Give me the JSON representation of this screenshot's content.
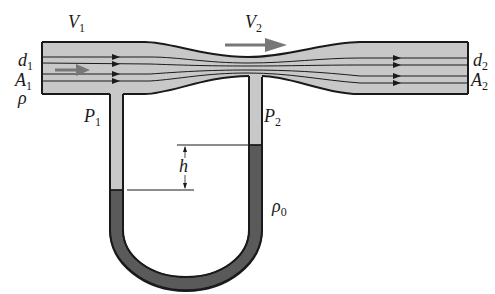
{
  "diagram": {
    "labels": {
      "v1": {
        "main": "V",
        "sub": "1"
      },
      "v2": {
        "main": "V",
        "sub": "2"
      },
      "d1": {
        "main": "d",
        "sub": "1"
      },
      "a1": {
        "main": "A",
        "sub": "1"
      },
      "rho": {
        "main": "ρ",
        "sub": ""
      },
      "p1": {
        "main": "P",
        "sub": "1"
      },
      "p2": {
        "main": "P",
        "sub": "2"
      },
      "d2": {
        "main": "d",
        "sub": "2"
      },
      "a2": {
        "main": "A",
        "sub": "2"
      },
      "h": {
        "main": "h",
        "sub": ""
      },
      "rho0": {
        "main": "ρ",
        "sub": "0"
      }
    },
    "colors": {
      "fluid": "#c8c8c8",
      "manometer_fluid": "#5a5a5a",
      "outline": "#1a1a1a",
      "flow_arrow": "#777777",
      "background": "#ffffff"
    }
  }
}
